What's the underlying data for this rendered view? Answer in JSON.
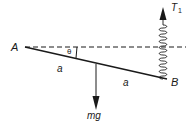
{
  "diagram": {
    "labels": {
      "point_a": "A",
      "point_b": "B",
      "angle": "θ",
      "half_length_left": "a",
      "half_length_right": "a",
      "weight": "mg",
      "tension": "T",
      "tension_subscript": "1"
    },
    "colors": {
      "stroke": "#1a1a1a",
      "background": "#ffffff"
    }
  }
}
